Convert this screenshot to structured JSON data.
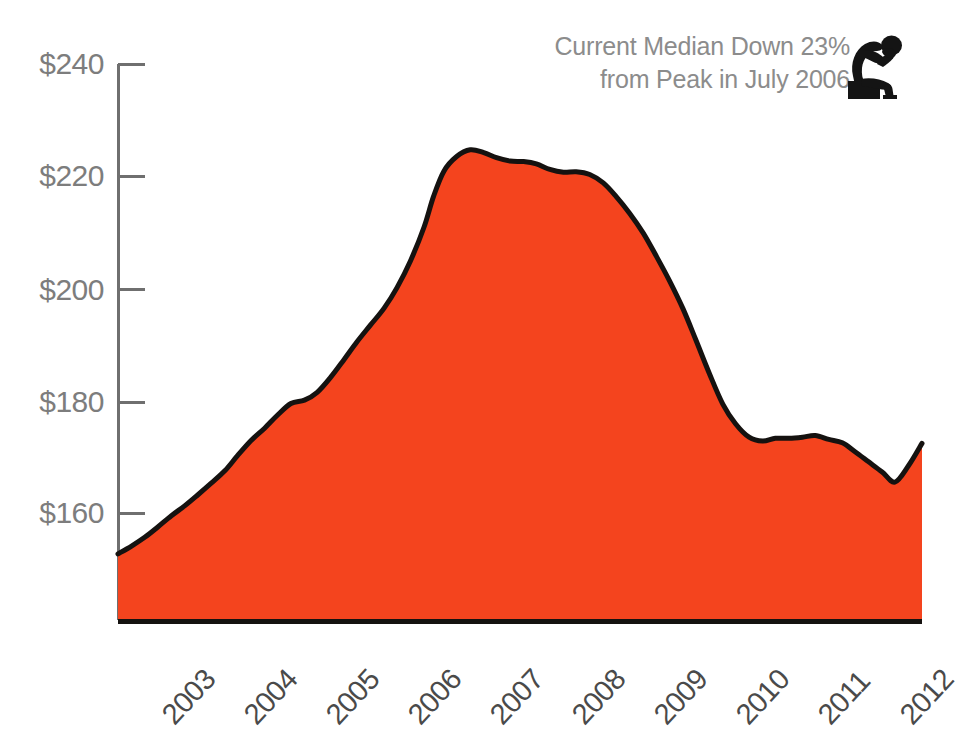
{
  "chart_data": {
    "type": "area",
    "title": "Current Median Down 23% from Peak in July 2006",
    "annotation_lines": [
      "Current Median Down 23%",
      "from Peak in July 2006"
    ],
    "annotation_icon": "thinking-person-icon",
    "xlabel": "",
    "ylabel": "",
    "x_tick_labels": [
      "2003",
      "2004",
      "2005",
      "2006",
      "2007",
      "2008",
      "2009",
      "2010",
      "2011",
      "2012"
    ],
    "y_tick_labels": [
      "$240",
      "$220",
      "$200",
      "$180",
      "$160"
    ],
    "y_tick_values": [
      240,
      220,
      200,
      180,
      160
    ],
    "ylim": [
      140.5,
      246
    ],
    "xlim": [
      2002.58,
      2012.67
    ],
    "grid": false,
    "legend": false,
    "units": "thousands of dollars (median home price)",
    "fill_color": "#F4441E",
    "line_color": "#151210",
    "axis_color": "#6f6f6f",
    "y_label_color": "#7d7d7d",
    "x_label_color": "#4a4a4a",
    "annotation_color": "#8c8c8c",
    "peak": {
      "x": 2006.54,
      "y": 224.8,
      "label": "July 2006"
    },
    "current": {
      "x": 2012.67,
      "y": 172.5
    },
    "decline_from_peak_pct": 23,
    "x": [
      2002.58,
      2002.75,
      2002.92,
      2003.08,
      2003.25,
      2003.42,
      2003.58,
      2003.75,
      2003.92,
      2004.08,
      2004.25,
      2004.42,
      2004.58,
      2004.75,
      2004.92,
      2005.08,
      2005.25,
      2005.42,
      2005.58,
      2005.75,
      2005.92,
      2006.08,
      2006.25,
      2006.42,
      2006.54,
      2006.67,
      2006.83,
      2007.0,
      2007.17,
      2007.33,
      2007.5,
      2007.67,
      2007.83,
      2008.0,
      2008.17,
      2008.33,
      2008.5,
      2008.67,
      2008.83,
      2009.0,
      2009.17,
      2009.33,
      2009.5,
      2009.67,
      2009.83,
      2010.0,
      2010.17,
      2010.33,
      2010.5,
      2010.67,
      2010.83,
      2011.0,
      2011.17,
      2011.33,
      2011.5,
      2011.67,
      2011.83,
      2012.0,
      2012.17,
      2012.33,
      2012.5,
      2012.67
    ],
    "y": [
      152.8,
      154.2,
      155.8,
      157.6,
      159.6,
      161.4,
      163.3,
      165.4,
      167.6,
      170.3,
      173.0,
      175.2,
      177.5,
      179.6,
      180.2,
      181.6,
      184.3,
      187.5,
      190.6,
      193.6,
      196.6,
      200.2,
      205.0,
      211.0,
      216.5,
      221.0,
      223.6,
      224.8,
      224.3,
      223.4,
      222.8,
      222.7,
      222.3,
      221.3,
      220.8,
      220.9,
      220.4,
      218.9,
      216.5,
      213.5,
      210.0,
      206.0,
      201.5,
      196.5,
      191.0,
      185.0,
      179.5,
      176.0,
      173.6,
      172.9,
      173.4,
      173.4,
      173.6,
      173.9,
      173.2,
      172.6,
      171.0,
      169.2,
      167.4,
      165.6,
      168.5,
      172.5
    ]
  },
  "axes": {
    "y_ticks": [
      {
        "label": "$240",
        "value": 240
      },
      {
        "label": "$220",
        "value": 220
      },
      {
        "label": "$200",
        "value": 200
      },
      {
        "label": "$180",
        "value": 180
      },
      {
        "label": "$160",
        "value": 160
      }
    ],
    "x_ticks": [
      {
        "label": "2003",
        "value": 2003
      },
      {
        "label": "2004",
        "value": 2004
      },
      {
        "label": "2005",
        "value": 2005
      },
      {
        "label": "2006",
        "value": 2006
      },
      {
        "label": "2007",
        "value": 2007
      },
      {
        "label": "2008",
        "value": 2008
      },
      {
        "label": "2009",
        "value": 2009
      },
      {
        "label": "2010",
        "value": 2010
      },
      {
        "label": "2011",
        "value": 2011
      },
      {
        "label": "2012",
        "value": 2012
      }
    ]
  },
  "annotation": {
    "line1": "Current Median Down 23%",
    "line2": "from Peak in July 2006",
    "icon": "thinking-person-icon"
  }
}
